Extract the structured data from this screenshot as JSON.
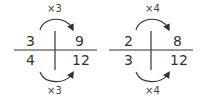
{
  "diagrams": [
    {
      "top_multiplier": "×3",
      "bottom_multiplier": "×3",
      "cells": {
        "top_left": "3",
        "top_right": "9",
        "bottom_left": "4",
        "bottom_right": "12"
      }
    },
    {
      "top_multiplier": "×4",
      "bottom_multiplier": "×4",
      "cells": {
        "top_left": "2",
        "top_right": "8",
        "bottom_left": "3",
        "bottom_right": "12"
      }
    }
  ],
  "colors": {
    "line": "#333333",
    "text": "#333333"
  }
}
